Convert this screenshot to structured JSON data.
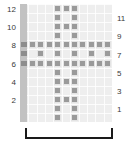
{
  "figure": {
    "background_color": "#ffffff",
    "grid_color": "#eeeeee",
    "marker_color": "#9a9a9a",
    "edge_band_color": "#c2c2c2",
    "bracket_color": "#1a1a1a"
  },
  "axes": {
    "left": {
      "labels": [
        "12",
        "10",
        "8",
        "6",
        "4",
        "2"
      ],
      "rows": [
        12,
        10,
        8,
        6,
        4,
        2
      ]
    },
    "right": {
      "labels": [
        "11",
        "9",
        "7",
        "5",
        "3",
        "1"
      ],
      "rows": [
        11,
        9,
        7,
        5,
        3,
        1
      ]
    }
  },
  "chart_data": {
    "type": "heatmap",
    "title": "",
    "xlabel": "",
    "ylabel": "",
    "grid": true,
    "legend": "none",
    "rows": 13,
    "cols": 11,
    "row_labels_left": [
      "12",
      "10",
      "8",
      "6",
      "4",
      "2"
    ],
    "row_labels_right": [
      "11",
      "9",
      "7",
      "5",
      "3",
      "1"
    ],
    "marker_matrix": [
      [
        0,
        0,
        0,
        0,
        1,
        1,
        1,
        0,
        0,
        0,
        0
      ],
      [
        0,
        0,
        0,
        0,
        1,
        0,
        1,
        0,
        0,
        0,
        0
      ],
      [
        0,
        0,
        0,
        0,
        1,
        1,
        1,
        0,
        0,
        0,
        0
      ],
      [
        0,
        0,
        0,
        0,
        1,
        0,
        1,
        0,
        0,
        0,
        0
      ],
      [
        1,
        1,
        1,
        1,
        1,
        1,
        1,
        1,
        1,
        1,
        1
      ],
      [
        1,
        0,
        1,
        0,
        1,
        0,
        1,
        0,
        1,
        0,
        1
      ],
      [
        1,
        1,
        1,
        1,
        1,
        1,
        1,
        1,
        1,
        1,
        1
      ],
      [
        0,
        0,
        0,
        0,
        1,
        0,
        1,
        0,
        0,
        0,
        0
      ],
      [
        0,
        0,
        0,
        0,
        1,
        1,
        1,
        0,
        0,
        0,
        0
      ],
      [
        0,
        0,
        0,
        0,
        1,
        0,
        1,
        0,
        0,
        0,
        0
      ],
      [
        0,
        0,
        0,
        0,
        1,
        1,
        1,
        0,
        0,
        0,
        0
      ],
      [
        0,
        0,
        0,
        0,
        1,
        0,
        1,
        0,
        0,
        0,
        0
      ],
      [
        0,
        0,
        0,
        0,
        1,
        0,
        1,
        0,
        0,
        0,
        0
      ]
    ],
    "edge_band_rows": [
      4,
      5,
      6
    ]
  },
  "bracket": {
    "label": "",
    "span_start_col": 0,
    "span_end_col": 10
  }
}
